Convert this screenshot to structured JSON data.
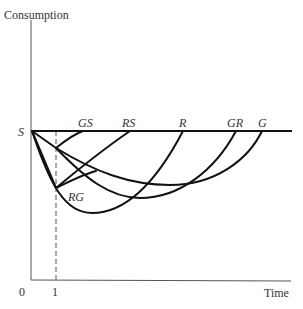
{
  "diagram": {
    "y_axis_label": "Consumption",
    "x_axis_label": "Time",
    "origin_label": "0",
    "tick_label": "1",
    "start_label": "S",
    "path_labels": {
      "gs": "GS",
      "rs": "RS",
      "r": "R",
      "gr": "GR",
      "g": "G",
      "rg": "RG"
    },
    "colors": {
      "curve": "#111111",
      "axis": "#444444",
      "text": "#333333"
    }
  }
}
